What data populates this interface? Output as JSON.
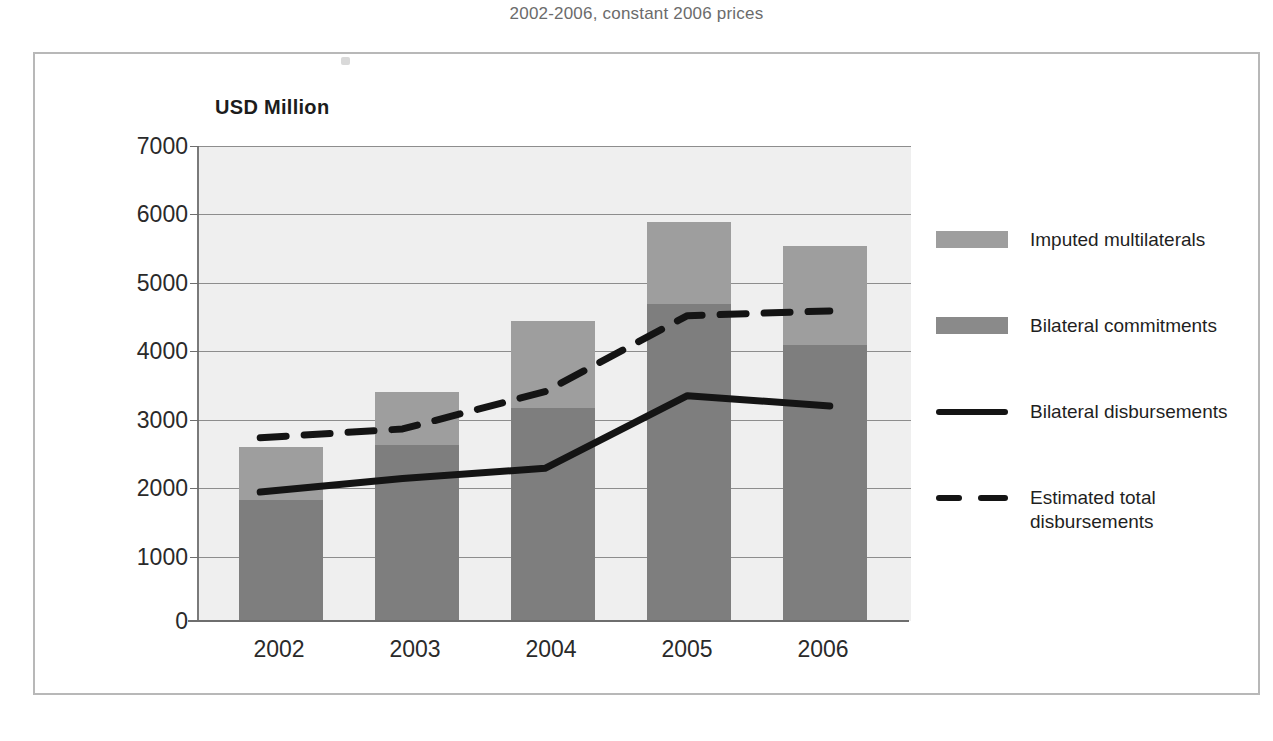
{
  "chart_title": "2002-2006, constant 2006 prices",
  "axis_unit_label": "USD Million",
  "chart_data": {
    "type": "bar",
    "title": "2002-2006, constant 2006 prices",
    "xlabel": "",
    "ylabel": "USD Million",
    "ylim": [
      0,
      7000
    ],
    "ytick_labels": [
      "0",
      "1000",
      "2000",
      "3000",
      "4000",
      "5000",
      "6000",
      "7000"
    ],
    "ytick_values": [
      0,
      1000,
      2000,
      3000,
      4000,
      5000,
      6000,
      7000
    ],
    "categories": [
      "2002",
      "2003",
      "2004",
      "2005",
      "2006"
    ],
    "grid": true,
    "legend_position": "right",
    "stacked": true,
    "series": [
      {
        "name": "Bilateral commitments",
        "kind": "bar-segment",
        "color": "#7e7e7e",
        "values": [
          1790,
          2590,
          3145,
          4665,
          4065
        ]
      },
      {
        "name": "Imputed multilaterals",
        "kind": "bar-segment",
        "color": "#9e9e9e",
        "values": [
          770,
          785,
          1270,
          1215,
          1460
        ]
      },
      {
        "name": "Bilateral disbursements",
        "kind": "line-solid",
        "color": "#141414",
        "values": [
          1900,
          2100,
          2250,
          3320,
          3170
        ]
      },
      {
        "name": "Estimated total disbursements",
        "kind": "line-dashed",
        "color": "#141414",
        "values": [
          2700,
          2830,
          3380,
          4500,
          4570
        ]
      }
    ],
    "bar_totals": [
      2560,
      3375,
      4415,
      5880,
      5525
    ]
  },
  "legend": {
    "items": [
      {
        "label": "Imputed multilaterals",
        "swatch": "imputed"
      },
      {
        "label": "Bilateral commitments",
        "swatch": "bilateral"
      },
      {
        "label": "Bilateral disbursements",
        "swatch": "solid-line"
      },
      {
        "label": "Estimated total\ndisbursements",
        "swatch": "dashed-line"
      }
    ]
  },
  "colors": {
    "imputed_multilaterals": "#9e9e9e",
    "bilateral_commitments": "#7e7e7e",
    "line": "#141414",
    "plot_background": "#efefef",
    "gridline": "#8d8d8d",
    "frame": "#b8b8b8"
  }
}
